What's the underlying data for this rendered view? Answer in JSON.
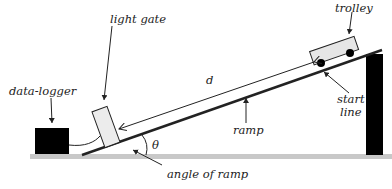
{
  "diagram": {
    "labels": {
      "trolley": "trolley",
      "light_gate": "light gate",
      "data_logger": "data-logger",
      "distance": "d",
      "start_line_1": "start",
      "start_line_2": "line",
      "ramp": "ramp",
      "theta": "θ",
      "angle_of_ramp": "angle of ramp"
    },
    "colors": {
      "floor": "#c8c8c8",
      "ramp": "#222222",
      "support": "#000000",
      "data_logger": "#000000",
      "light_gate_fill": "#ececec",
      "trolley_fill": "#e6e6e6",
      "wheel": "#000000"
    }
  }
}
